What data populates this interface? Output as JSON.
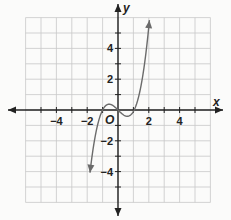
{
  "chart_data": {
    "type": "line",
    "title": "",
    "xlabel": "x",
    "ylabel": "y",
    "origin_label": "O",
    "xlim": [
      -6,
      6
    ],
    "ylim": [
      -6,
      6
    ],
    "grid": true,
    "x_ticks": [
      -4,
      -2,
      2,
      4
    ],
    "x_tick_labels": [
      "−4",
      "−2",
      "2",
      "4"
    ],
    "y_ticks": [
      4,
      2,
      -2,
      -4
    ],
    "y_tick_labels": [
      "4",
      "2",
      "−2",
      "−4"
    ],
    "series": [
      {
        "name": "f(x)",
        "description": "cubic curve with arrowheads on both ends; local max near (-0.5, 0.4), local min near (0.6, -0.3)",
        "x": [
          -1.8,
          -1.5,
          -1.2,
          -1.0,
          -0.8,
          -0.5,
          -0.2,
          0.0,
          0.3,
          0.6,
          0.9,
          1.2,
          1.5,
          1.8,
          2.0
        ],
        "y": [
          -5.7,
          -2.6,
          -0.8,
          0.0,
          0.3,
          0.4,
          0.2,
          0.0,
          -0.2,
          -0.3,
          -0.1,
          0.6,
          2.0,
          4.2,
          6.0
        ]
      }
    ],
    "colors": {
      "curve": "#6b6b6b",
      "grid": "#c8c8c8",
      "axis": "#222222"
    }
  }
}
